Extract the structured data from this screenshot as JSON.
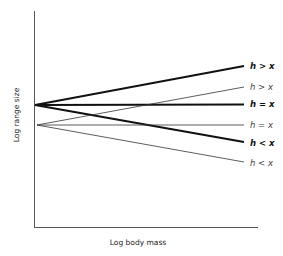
{
  "diagram": {
    "axes": {
      "x_label": "Log body mass",
      "y_label": "Log range size",
      "color": "#555555"
    },
    "lines": [
      {
        "id": "bold-h-gt-x",
        "label": "h > x",
        "weight": "bold",
        "x1": 35,
        "y1": 105,
        "x2": 244,
        "y2": 66
      },
      {
        "id": "thin-h-gt-x",
        "label": "h > x",
        "weight": "thin",
        "x1": 37,
        "y1": 125,
        "x2": 244,
        "y2": 87
      },
      {
        "id": "bold-h-eq-x",
        "label": "h = x",
        "weight": "bold",
        "x1": 35,
        "y1": 105,
        "x2": 244,
        "y2": 104
      },
      {
        "id": "thin-h-eq-x",
        "label": "h = x",
        "weight": "thin",
        "x1": 37,
        "y1": 125,
        "x2": 244,
        "y2": 125
      },
      {
        "id": "bold-h-lt-x",
        "label": "h < x",
        "weight": "bold",
        "x1": 35,
        "y1": 105,
        "x2": 244,
        "y2": 142
      },
      {
        "id": "thin-h-lt-x",
        "label": "h < x",
        "weight": "thin",
        "x1": 37,
        "y1": 125,
        "x2": 244,
        "y2": 162
      }
    ],
    "labels": {
      "bold_gt": "h > x",
      "thin_gt": "h > x",
      "bold_eq": "h = x",
      "thin_eq": "h = x",
      "bold_lt": "h < x",
      "thin_lt": "h < x"
    }
  }
}
